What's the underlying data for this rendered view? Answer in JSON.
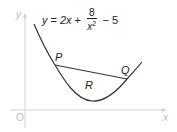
{
  "diagram": {
    "type": "function-graph",
    "equation": {
      "lhs": "y",
      "eq": "=",
      "term1": "2x",
      "plus": "+",
      "frac_num": "8",
      "frac_den_base": "x",
      "frac_den_exp": "2",
      "minus": "−",
      "const": "5",
      "full_text": "y = 2x + 8/x² − 5"
    },
    "axes": {
      "x_label": "x",
      "y_label": "y",
      "origin_label": "O",
      "color": "#cccccc"
    },
    "points": [
      {
        "label": "P",
        "description": "left intersection of chord with curve"
      },
      {
        "label": "Q",
        "description": "right intersection of chord with curve"
      }
    ],
    "region": {
      "label": "R",
      "description": "region bounded by curve and chord PQ"
    },
    "curve_color": "#333333",
    "chord": {
      "from": "P",
      "to": "Q"
    }
  }
}
